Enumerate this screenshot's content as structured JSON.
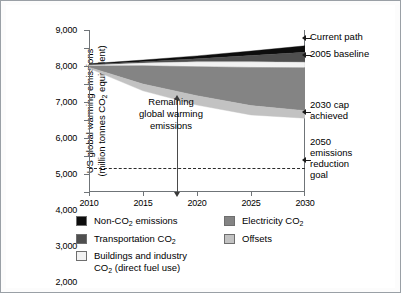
{
  "chart_data": {
    "type": "area",
    "title": "",
    "xlabel": "",
    "ylabel": "US global warming emissions (million tonnes CO2 equivalent)",
    "ylabel_line1": "US global warming emissions",
    "ylabel_line2": "(million tonnes CO2 equivalent)",
    "x": [
      2010,
      2015,
      2020,
      2025,
      2030
    ],
    "xlim": [
      2010,
      2030
    ],
    "ylim": [
      0,
      9000
    ],
    "xticks": [
      "2010",
      "2015",
      "2020",
      "2025",
      "2030"
    ],
    "yticks": [
      "0",
      "1,000",
      "2,000",
      "3,000",
      "4,000",
      "5,000",
      "6,000",
      "7,000",
      "8,000",
      "9,000"
    ],
    "grid": false,
    "legend_position": "below",
    "stacking": "stacked-from-top",
    "series": [
      {
        "name": "Non-CO2 emissions",
        "color": "#0d0d0d",
        "top": [
          7120,
          7330,
          7560,
          7830,
          8120
        ],
        "bottom": [
          7080,
          7230,
          7400,
          7580,
          7760
        ]
      },
      {
        "name": "Transportation CO2",
        "color": "#4f4f4f",
        "top": [
          7080,
          7230,
          7400,
          7580,
          7760
        ],
        "bottom": [
          7040,
          7160,
          7230,
          7230,
          7210
        ]
      },
      {
        "name": "Buildings and industry CO2 (direct fuel use)",
        "color": "#f2f2f2",
        "top": [
          7040,
          7160,
          7230,
          7230,
          7210
        ],
        "bottom": [
          7000,
          7010,
          6960,
          6920,
          6900
        ]
      },
      {
        "name": "Electricity CO2",
        "color": "#848484",
        "top": [
          7000,
          7010,
          6960,
          6920,
          6900
        ],
        "bottom": [
          6930,
          6000,
          5350,
          4800,
          4520
        ]
      },
      {
        "name": "Offsets",
        "color": "#c2c2c2",
        "top": [
          6930,
          6000,
          5350,
          4800,
          4520
        ],
        "bottom": [
          6870,
          5620,
          4830,
          4280,
          4100
        ]
      }
    ],
    "reference_lines": [
      {
        "name": "2050 emissions reduction goal",
        "value": 1330,
        "style": "dashed"
      }
    ],
    "annotations": [
      {
        "name": "Current path",
        "value": 8120
      },
      {
        "name": "2005 baseline",
        "value": 7210
      },
      {
        "name": "2030 cap achieved",
        "value": 4100
      },
      {
        "name": "2050 emissions reduction goal",
        "value": 1330
      }
    ]
  },
  "axis": {
    "y_title_line1": "US global warming emissions",
    "y_title_line2a": "(million tonnes CO",
    "y_title_sub": "2",
    "y_title_line2b": " equivalent)",
    "yticks": [
      "9,000",
      "8,000",
      "7,000",
      "6,000",
      "5,000",
      "4,000",
      "3,000",
      "2,000",
      "1,000",
      "0"
    ],
    "xticks": [
      "2010",
      "2015",
      "2020",
      "2025",
      "2030"
    ]
  },
  "callout": {
    "remaining_line1": "Remaining",
    "remaining_line2": "global warming",
    "remaining_line3": "emissions"
  },
  "right_annotations": {
    "current_path": "Current path",
    "baseline_2005": "2005 baseline",
    "cap_2030_line1": "2030 cap",
    "cap_2030_line2": "achieved",
    "goal_2050_line1": "2050",
    "goal_2050_line2": "emissions",
    "goal_2050_line3": "reduction",
    "goal_2050_line4": "goal"
  },
  "legend": {
    "col1": [
      {
        "label_pre": "Non-CO",
        "sub": "2",
        "label_post": " emissions",
        "color": "#0d0d0d"
      },
      {
        "label_pre": "Transportation CO",
        "sub": "2",
        "label_post": "",
        "color": "#4f4f4f"
      },
      {
        "label_pre": "Buildings and industry",
        "sub": "",
        "label_post": "",
        "color": "#f2f2f2",
        "line2_pre": "CO",
        "line2_sub": "2",
        "line2_post": " (direct fuel use)"
      }
    ],
    "col2": [
      {
        "label_pre": "Electricity CO",
        "sub": "2",
        "label_post": "",
        "color": "#848484"
      },
      {
        "label_pre": "Offsets",
        "sub": "",
        "label_post": "",
        "color": "#c2c2c2"
      }
    ]
  }
}
